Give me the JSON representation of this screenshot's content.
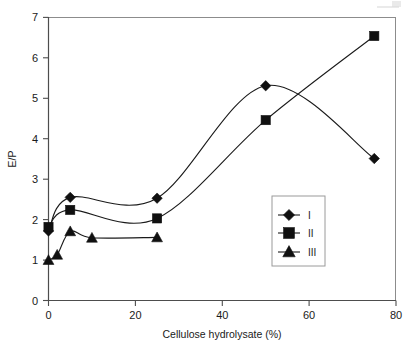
{
  "chart_data": {
    "type": "line",
    "title": "",
    "xlabel": "Cellulose hydrolysate (%)",
    "ylabel": "E/P",
    "xlim": [
      0,
      80
    ],
    "ylim": [
      0,
      7
    ],
    "xticks": [
      0,
      20,
      40,
      60,
      80
    ],
    "yticks": [
      0,
      1,
      2,
      3,
      4,
      5,
      6,
      7
    ],
    "xtick_labels": [
      "0",
      "20",
      "40",
      "60",
      "80"
    ],
    "ytick_labels": [
      "0",
      "1",
      "2",
      "3",
      "4",
      "5",
      "6",
      "7"
    ],
    "grid": false,
    "legend_position": "inner-lower-right",
    "series": [
      {
        "name": "I",
        "marker": "diamond",
        "color": "#101010",
        "x": [
          0,
          5,
          25,
          50,
          75
        ],
        "values": [
          1.72,
          2.55,
          2.53,
          5.31,
          3.51
        ]
      },
      {
        "name": "II",
        "marker": "square",
        "color": "#101010",
        "x": [
          0,
          5,
          25,
          50,
          75
        ],
        "values": [
          1.82,
          2.24,
          2.03,
          4.46,
          6.54
        ]
      },
      {
        "name": "III",
        "marker": "triangle",
        "color": "#101010",
        "x": [
          0,
          2,
          5,
          10,
          25
        ],
        "values": [
          1.0,
          1.13,
          1.71,
          1.55,
          1.56
        ]
      }
    ]
  },
  "legend": {
    "entries": [
      {
        "label": "I",
        "marker": "diamond"
      },
      {
        "label": "II",
        "marker": "square"
      },
      {
        "label": "III",
        "marker": "triangle"
      }
    ]
  },
  "axes": {
    "x_title": "Cellulose hydrolysate (%)",
    "y_title": "E/P"
  },
  "colors": {
    "ink": "#101010",
    "axis": "#4d4d4d",
    "frame": "#8c8c8c",
    "background": "#ffffff"
  }
}
